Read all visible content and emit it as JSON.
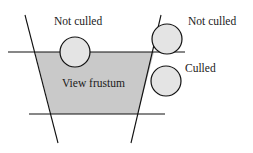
{
  "diagram": {
    "frustum": {
      "label": "View frustum",
      "fill": "#c9c9c9",
      "polygon": [
        [
          35,
          52
        ],
        [
          154,
          52
        ],
        [
          138,
          114
        ],
        [
          51,
          114
        ]
      ]
    },
    "lines": [
      {
        "name": "left-plane",
        "x1": 25,
        "y1": 15,
        "x2": 58,
        "y2": 143
      },
      {
        "name": "right-plane",
        "x1": 161,
        "y1": 15,
        "x2": 131,
        "y2": 143
      },
      {
        "name": "near-plane",
        "x1": 8,
        "y1": 52,
        "x2": 185,
        "y2": 52
      },
      {
        "name": "far-plane",
        "x1": 29,
        "y1": 114,
        "x2": 165,
        "y2": 114
      }
    ],
    "objects": [
      {
        "name": "sphere-top",
        "cx": 75,
        "cy": 52,
        "r": 15,
        "label": "Not culled",
        "label_x": 54,
        "label_y": 16
      },
      {
        "name": "sphere-right-top",
        "cx": 167,
        "cy": 39,
        "r": 15,
        "label": "Not culled",
        "label_x": 188,
        "label_y": 16
      },
      {
        "name": "sphere-right",
        "cx": 166,
        "cy": 81,
        "r": 15,
        "label": "Culled",
        "label_x": 185,
        "label_y": 63
      }
    ],
    "sphere_fill": "#e4e4e4",
    "stroke": "#111111"
  }
}
